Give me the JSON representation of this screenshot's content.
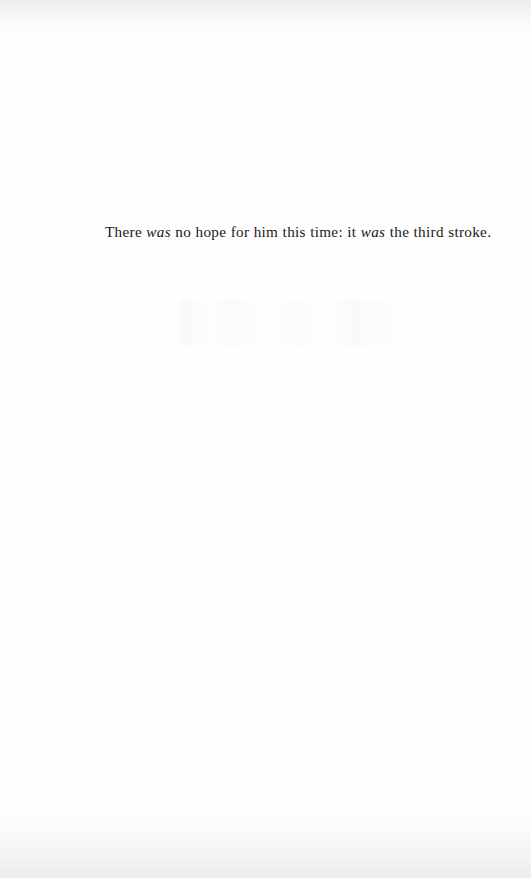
{
  "page": {
    "kind": "scanned-book-page",
    "width": 531,
    "height": 878,
    "background_color": "#fefefe",
    "text_color": "#191919",
    "edge_shade_color": "#ececed"
  },
  "content": {
    "line": {
      "full_text": "There was no hope for him this time: it was the third stroke.",
      "segments": [
        {
          "text": "There ",
          "style": "roman"
        },
        {
          "text": "was",
          "style": "italic"
        },
        {
          "text": " no hope for him this time: it ",
          "style": "roman"
        },
        {
          "text": "was",
          "style": "italic"
        },
        {
          "text": " the third stroke.",
          "style": "roman"
        }
      ]
    }
  },
  "artifacts": {
    "scan_edge_top_label": "scanner-edge-shading-top",
    "scan_edge_bottom_label": "scanner-edge-shading-bottom",
    "show_through_label": "verso-show-through-ghosting",
    "paper_grain_label": "paper-grain-speckle"
  }
}
